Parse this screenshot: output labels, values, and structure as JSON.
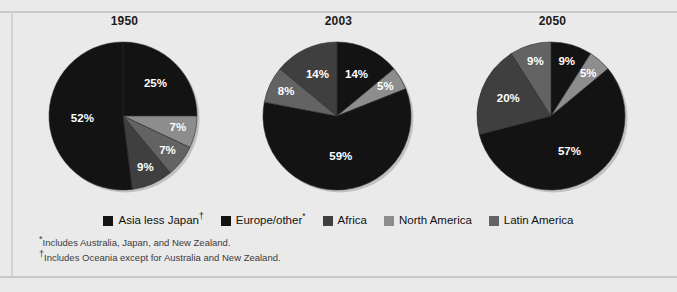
{
  "chart_data": [
    {
      "type": "pie",
      "title": "1950",
      "categories": [
        "Asia less Japan",
        "Europe/other",
        "Africa",
        "North America",
        "Latin America"
      ],
      "values": [
        52,
        25,
        9,
        7,
        7
      ],
      "labels": [
        "52%",
        "25%",
        "9%",
        "7%",
        "7%"
      ],
      "legend_position": "bottom",
      "colors": [
        "#131313",
        "#131313",
        "#3f3f3f",
        "#8d8d8d",
        "#636363"
      ],
      "slices": [
        {
          "name": "Europe/other",
          "value": 25,
          "label": "25%",
          "color": "#131313",
          "label_color": "#ffffff"
        },
        {
          "name": "North America",
          "value": 7,
          "label": "7%",
          "color": "#8d8d8d",
          "label_color": "#1a1a1a"
        },
        {
          "name": "Latin America",
          "value": 7,
          "label": "7%",
          "color": "#636363",
          "label_color": "#ffffff"
        },
        {
          "name": "Africa",
          "value": 9,
          "label": "9%",
          "color": "#3f3f3f",
          "label_color": "#ffffff"
        },
        {
          "name": "Asia less Japan",
          "value": 52,
          "label": "52%",
          "color": "#131313",
          "label_color": "#ffffff"
        }
      ]
    },
    {
      "type": "pie",
      "title": "2003",
      "categories": [
        "Asia less Japan",
        "Europe/other",
        "Africa",
        "North America",
        "Latin America"
      ],
      "values": [
        59,
        14,
        14,
        5,
        8
      ],
      "labels": [
        "59%",
        "14%",
        "14%",
        "5%",
        "8%"
      ],
      "legend_position": "bottom",
      "colors": [
        "#131313",
        "#131313",
        "#3f3f3f",
        "#8d8d8d",
        "#636363"
      ],
      "slices": [
        {
          "name": "Europe/other",
          "value": 14,
          "label": "14%",
          "color": "#131313",
          "label_color": "#ffffff"
        },
        {
          "name": "North America",
          "value": 5,
          "label": "5%",
          "color": "#8d8d8d",
          "label_color": "#1a1a1a"
        },
        {
          "name": "Asia less Japan",
          "value": 59,
          "label": "59%",
          "color": "#131313",
          "label_color": "#ffffff"
        },
        {
          "name": "Latin America",
          "value": 8,
          "label": "8%",
          "color": "#636363",
          "label_color": "#ffffff"
        },
        {
          "name": "Africa",
          "value": 14,
          "label": "14%",
          "color": "#3f3f3f",
          "label_color": "#ffffff"
        }
      ]
    },
    {
      "type": "pie",
      "title": "2050",
      "categories": [
        "Asia less Japan",
        "Europe/other",
        "Africa",
        "North America",
        "Latin America"
      ],
      "values": [
        57,
        9,
        20,
        5,
        9
      ],
      "labels": [
        "57%",
        "9%",
        "20%",
        "5%",
        "9%"
      ],
      "legend_position": "bottom",
      "colors": [
        "#131313",
        "#131313",
        "#3f3f3f",
        "#8d8d8d",
        "#636363"
      ],
      "slices": [
        {
          "name": "Europe/other",
          "value": 9,
          "label": "9%",
          "color": "#131313",
          "label_color": "#ffffff"
        },
        {
          "name": "North America",
          "value": 5,
          "label": "5%",
          "color": "#8d8d8d",
          "label_color": "#1a1a1a"
        },
        {
          "name": "Asia less Japan",
          "value": 57,
          "label": "57%",
          "color": "#131313",
          "label_color": "#ffffff"
        },
        {
          "name": "Africa",
          "value": 20,
          "label": "20%",
          "color": "#3f3f3f",
          "label_color": "#ffffff"
        },
        {
          "name": "Latin America",
          "value": 9,
          "label": "9%",
          "color": "#636363",
          "label_color": "#ffffff"
        }
      ]
    }
  ],
  "legend": {
    "items": [
      {
        "label": "Asia less Japan",
        "mark": "†",
        "color": "#131313"
      },
      {
        "label": "Europe/other",
        "mark": "*",
        "color": "#131313"
      },
      {
        "label": "Africa",
        "mark": "",
        "color": "#3f3f3f"
      },
      {
        "label": "North America",
        "mark": "",
        "color": "#8d8d8d"
      },
      {
        "label": "Latin America",
        "mark": "",
        "color": "#636363"
      }
    ]
  },
  "footnotes": [
    {
      "mark": "*",
      "text": "Includes Australia, Japan, and New Zealand."
    },
    {
      "mark": "†",
      "text": "Includes Oceania except for Australia and New Zealand."
    }
  ]
}
